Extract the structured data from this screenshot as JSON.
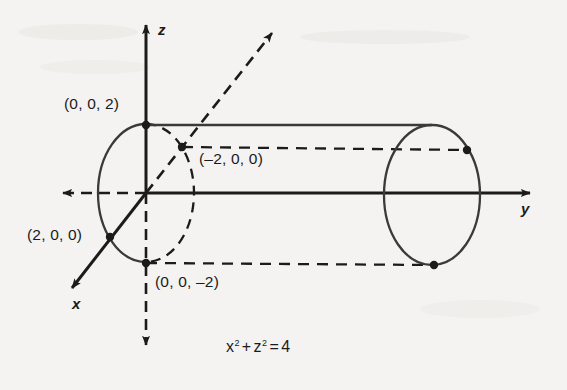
{
  "figure": {
    "background_color": "#f4f3f1",
    "ink_color": "#1b1b1b",
    "equation": {
      "full": "x² + z² = 4",
      "term1_base": "x",
      "term1_exp": "2",
      "plus": "+",
      "term2_base": "z",
      "term2_exp": "2",
      "equals": "=",
      "value": "4"
    },
    "axes": [
      {
        "name": "z",
        "label": "z",
        "direction": "up",
        "solid": true
      },
      {
        "name": "y",
        "label": "y",
        "direction": "right",
        "solid": true
      },
      {
        "name": "x",
        "label": "x",
        "direction": "lower-left",
        "solid": true
      }
    ],
    "negative_axes": [
      {
        "name": "negative-z",
        "direction": "down",
        "style": "dashed"
      },
      {
        "name": "negative-y",
        "direction": "left",
        "style": "dashed"
      },
      {
        "name": "negative-x",
        "direction": "upper-right",
        "style": "dashed"
      }
    ],
    "points": [
      {
        "id": "p-z-pos",
        "label": "(0, 0, 2)",
        "x": 146,
        "y": 125
      },
      {
        "id": "p-z-neg",
        "label": "(0, 0, -2)",
        "x": 146,
        "y": 263
      },
      {
        "id": "p-x-pos",
        "label": "(2, 0, 0)",
        "x": 110,
        "y": 237
      },
      {
        "id": "p-x-neg",
        "label": "(-2, 0, 0)",
        "x": 182,
        "y": 147
      },
      {
        "id": "p-far-top",
        "label": "",
        "x": 467,
        "y": 150
      },
      {
        "id": "p-far-bottom",
        "label": "",
        "x": 434,
        "y": 265
      }
    ],
    "labels": {
      "z_axis": "z",
      "y_axis": "y",
      "x_axis": "x",
      "point_z_pos": "(0, 0, 2)",
      "point_z_neg": "(0, 0, –2)",
      "point_x_pos": "(2, 0, 0)",
      "point_x_neg": "(–2, 0, 0)"
    },
    "cylinder": {
      "radius": 2,
      "near_ellipse": {
        "cx": 146,
        "cy": 193,
        "rx": 48,
        "ry": 69,
        "front_half": "solid",
        "back_half": "dashed"
      },
      "far_ellipse": {
        "cx": 432,
        "cy": 195,
        "rx": 48,
        "ry": 70,
        "style": "solid"
      },
      "rulings": [
        {
          "id": "ruling-top-solid",
          "style": "solid",
          "from": [
            146,
            125
          ],
          "to": [
            432,
            125
          ]
        },
        {
          "id": "ruling-top-dashed",
          "style": "dashed",
          "from": [
            182,
            147
          ],
          "to": [
            467,
            150
          ]
        },
        {
          "id": "ruling-bottom-dashed",
          "style": "dashed",
          "from": [
            146,
            263
          ],
          "to": [
            434,
            265
          ]
        }
      ]
    }
  }
}
